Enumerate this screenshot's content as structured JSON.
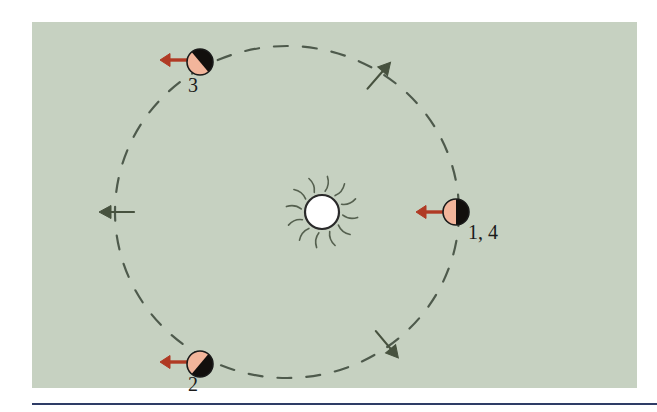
{
  "figure": {
    "kind": "orbit-diagram",
    "caption_rule_color": "#2e3c66",
    "panel": {
      "background_color": "#c6d1c1",
      "x": 32,
      "y": 22,
      "width": 605,
      "height": 366
    }
  },
  "sun": {
    "name": "sun",
    "cx": 322,
    "cy": 212,
    "radius": 17,
    "fill_color": "#ffffff",
    "outline_color": "#2a2a2a",
    "ray_color": "#55604f",
    "ray_count": 12
  },
  "orbit": {
    "name": "orbital-path",
    "cx": 287,
    "cy": 212,
    "rx": 172,
    "ry": 166,
    "stroke_color": "#4e5a4c",
    "stroke_width": 2.2,
    "dash_pattern": "14 15",
    "style": "dashed"
  },
  "direction_arrows": [
    {
      "name": "orbit-direction-arrow-left",
      "position": "left",
      "x": 112,
      "y": 212,
      "angle_deg": 90,
      "color": "#47523f"
    },
    {
      "name": "orbit-direction-arrow-bottom-right",
      "position": "bottom-right",
      "x": 390,
      "y": 348,
      "angle_deg": -40,
      "color": "#47523f"
    },
    {
      "name": "orbit-direction-arrow-top-right",
      "position": "top-right",
      "x": 382,
      "y": 72,
      "angle_deg": -139,
      "color": "#47523f"
    }
  ],
  "planets": [
    {
      "label": "1, 4",
      "name": "planet-1-4",
      "cx": 456,
      "cy": 212,
      "radius": 13,
      "dark_color": "#120f0d",
      "light_color": "#f2b59b",
      "outline_color": "#1b1b1b",
      "split_angle_deg": 0,
      "light_side": "left",
      "label_x": 468,
      "label_y": 239,
      "label_anchor": "start",
      "arrow": {
        "name": "velocity-arrow-planet-1-4",
        "from_x": 443,
        "from_y": 212,
        "to_x": 416,
        "to_y": 212,
        "color": "#b03a24",
        "direction": "left"
      }
    },
    {
      "label": "2",
      "name": "planet-2",
      "cx": 200,
      "cy": 364,
      "radius": 13,
      "dark_color": "#120f0d",
      "light_color": "#f2b59b",
      "outline_color": "#1b1b1b",
      "split_angle_deg": 40,
      "light_side": "upper-right",
      "label_x": 193,
      "label_y": 391,
      "label_anchor": "middle",
      "arrow": {
        "name": "velocity-arrow-planet-2",
        "from_x": 187,
        "from_y": 362,
        "to_x": 160,
        "to_y": 362,
        "color": "#b03a24",
        "direction": "left"
      }
    },
    {
      "label": "3",
      "name": "planet-3",
      "cx": 200,
      "cy": 62,
      "radius": 13,
      "dark_color": "#120f0d",
      "light_color": "#f2b59b",
      "outline_color": "#1b1b1b",
      "split_angle_deg": -40,
      "light_side": "lower-right",
      "label_x": 193,
      "label_y": 92,
      "label_anchor": "middle",
      "arrow": {
        "name": "velocity-arrow-planet-3",
        "from_x": 187,
        "from_y": 60,
        "to_x": 160,
        "to_y": 60,
        "color": "#b03a24",
        "direction": "left"
      }
    }
  ],
  "bottom_rule": {
    "name": "caption-divider",
    "x": 32,
    "y": 403,
    "width": 625,
    "height": 2,
    "color": "#2e3c66"
  }
}
